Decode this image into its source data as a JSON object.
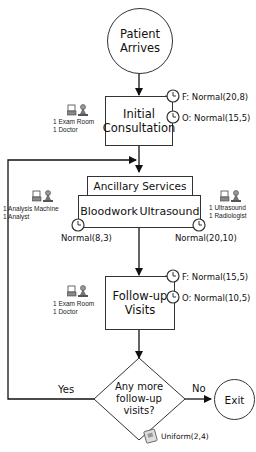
{
  "diagram": {
    "start": {
      "label_line1": "Patient",
      "label_line2": "Arrives"
    },
    "initial_consultation": {
      "label_line1": "Initial",
      "label_line2": "Consultation",
      "resources": [
        "1 Exam Room",
        "1 Doctor"
      ],
      "times": [
        "F: Normal(20,8)",
        "O: Normal(15,5)"
      ]
    },
    "ancillary": {
      "header": "Ancillary Services",
      "bloodwork": {
        "label": "Bloodwork",
        "resources": [
          "1 Analysis Machine",
          "1 Analyst"
        ],
        "time": "Normal(8,3)"
      },
      "ultrasound": {
        "label": "Ultrasound",
        "resources": [
          "1 Ultrasound",
          "1 Radiologist"
        ],
        "time": "Normal(20,10)"
      }
    },
    "followup": {
      "label_line1": "Follow-up",
      "label_line2": "Visits",
      "resources": [
        "1 Exam Room",
        "1 Doctor"
      ],
      "times": [
        "F: Normal(15,5)",
        "O: Normal(10,5)"
      ]
    },
    "decision": {
      "label_line1": "Any more",
      "label_line2": "follow-up",
      "label_line3": "visits?",
      "yes_label": "Yes",
      "no_label": "No",
      "distribution": "Uniform(2,4)"
    },
    "exit": {
      "label": "Exit"
    }
  }
}
